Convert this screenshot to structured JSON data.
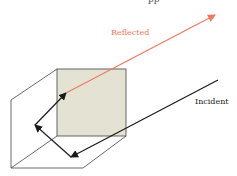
{
  "diagram": {
    "type": "corner-reflector",
    "top_caption_partial": "pp",
    "labels": {
      "reflected": "Reflected",
      "incident": "Incident"
    },
    "colors": {
      "reflected": "#f07860",
      "incident": "#1a1a1a",
      "face_fill": "#e4e2d2",
      "edge": "#444444",
      "face_edge": "#555555"
    },
    "geometry": {
      "face_square": {
        "x": 57,
        "y": 69,
        "w": 69,
        "h": 67
      },
      "outer_vertex_top_left": [
        11,
        100
      ],
      "outer_vertex_bottom_left": [
        11,
        168
      ],
      "outer_vertex_bottom_right": [
        83,
        168
      ],
      "incident_ray": {
        "from": [
          218,
          80
        ],
        "to": [
          71,
          157
        ]
      },
      "bounce_1": {
        "from": [
          71,
          157
        ],
        "to": [
          35,
          125
        ]
      },
      "bounce_2": {
        "from": [
          35,
          125
        ],
        "to": [
          66,
          93
        ]
      },
      "reflected_ray": {
        "from": [
          66,
          93
        ],
        "to": [
          215,
          15
        ]
      }
    }
  }
}
